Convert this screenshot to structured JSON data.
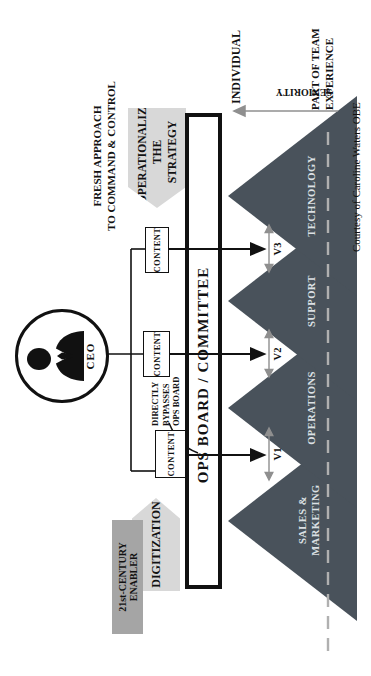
{
  "colors": {
    "pyramid": "#49525b",
    "arrow_gray": "#d8d8d8",
    "enabler_gray": "#a5a5a5",
    "line_gray": "#8f8f8f",
    "dash_gray": "#b0b0b0",
    "ink": "#121212"
  },
  "ceo": {
    "label": "CEO"
  },
  "arrows": {
    "digitization": "DIGITIZATION",
    "enabler": "21st-CENTURY ENABLER",
    "operationalize": [
      "OPERATIONALIZE",
      "THE STRATEGY"
    ]
  },
  "annotations": {
    "fresh_approach": [
      "FRESH APPROACH",
      "TO COMMAND & CONTROL"
    ],
    "bypass": [
      "DIRECTLY",
      "BYPASSES",
      "OPS BOARD"
    ]
  },
  "board": {
    "label": "OPS BOARD / COMMITTEE"
  },
  "content_boxes": [
    "CONTENT",
    "CONTENT",
    "CONTENT"
  ],
  "valleys": [
    "V1",
    "V2",
    "V3"
  ],
  "pyramids": [
    {
      "lines": [
        "SALES &",
        "MARKETING"
      ]
    },
    {
      "lines": [
        "OPERATIONS",
        ""
      ]
    },
    {
      "lines": [
        "SUPPORT",
        ""
      ]
    },
    {
      "lines": [
        "TECHNOLOGY",
        ""
      ]
    }
  ],
  "axis": {
    "individual": "INDIVIDUAL",
    "seniority": "SENIORITY",
    "team": [
      "PART OF TEAM",
      "EXPERIENCE"
    ]
  },
  "credit": "Courtesy of Caroline Waters OBE"
}
